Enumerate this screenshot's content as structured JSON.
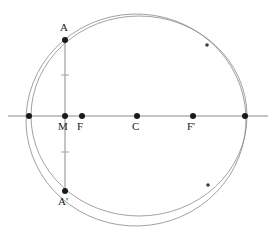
{
  "figure": {
    "title_fragment": "",
    "type": "geometry-diagram",
    "background_color": "#ffffff",
    "curve_color": "#8a8a8a",
    "axis_color": "#8a8a8a",
    "point_color": "#1a1a1a",
    "label_color": "#1a1a1a"
  },
  "labels": {
    "A": "A",
    "A_prime": "A'",
    "M": "M",
    "F": "F",
    "C": "C",
    "F_prime": "F'"
  },
  "chart_data": {
    "type": "scatter",
    "title": "",
    "xlabel": "",
    "ylabel": "",
    "grid": false,
    "legend": null,
    "xlim": [
      0,
      274
    ],
    "ylim": [
      228,
      0
    ],
    "axes": [
      {
        "name": "horizontal-axis",
        "x1": 8,
        "y1": 116,
        "x2": 268,
        "y2": 116
      },
      {
        "name": "vertical-chord",
        "x1": 65,
        "y1": 39,
        "x2": 65,
        "y2": 192
      }
    ],
    "ticks": [
      {
        "name": "upper-tick",
        "x": 65,
        "y": 75,
        "half_width": 4
      },
      {
        "name": "lower-tick",
        "x": 65,
        "y": 152,
        "half_width": 4
      }
    ],
    "points": [
      {
        "label": "",
        "name": "left-vertex-point",
        "x": 29,
        "y": 116,
        "r": 3.0
      },
      {
        "label": "M",
        "name": "point-m",
        "x": 65,
        "y": 116,
        "r": 3.0
      },
      {
        "label": "F",
        "name": "point-f",
        "x": 82,
        "y": 116,
        "r": 3.0
      },
      {
        "label": "C",
        "name": "point-c",
        "x": 137,
        "y": 116,
        "r": 3.0
      },
      {
        "label": "F'",
        "name": "point-f-prime",
        "x": 193,
        "y": 116,
        "r": 3.0
      },
      {
        "label": "",
        "name": "right-vertex-point",
        "x": 245,
        "y": 116,
        "r": 3.0
      },
      {
        "label": "A",
        "name": "point-a",
        "x": 65,
        "y": 40,
        "r": 3.0
      },
      {
        "label": "A'",
        "name": "point-a-prime",
        "x": 65,
        "y": 191,
        "r": 3.0
      },
      {
        "label": "",
        "name": "upper-right-intersection",
        "x": 207,
        "y": 45,
        "r": 1.8
      },
      {
        "label": "",
        "name": "lower-right-intersection",
        "x": 208,
        "y": 185,
        "r": 1.8
      }
    ],
    "curves": [
      {
        "name": "circle-curve",
        "kind": "ellipse",
        "cx": 139,
        "cy": 116,
        "rx": 108,
        "ry": 100,
        "rotation": 0
      },
      {
        "name": "ellipse-curve",
        "kind": "ellipse",
        "cx": 136,
        "cy": 120,
        "rx": 110,
        "ry": 106,
        "rotation": -2
      }
    ],
    "point_labels": [
      {
        "key": "A",
        "name": "label-a",
        "text": "A",
        "x": 60,
        "y": 22
      },
      {
        "key": "A_prime",
        "name": "label-a-prime",
        "text": "A'",
        "x": 58,
        "y": 196
      },
      {
        "key": "M",
        "name": "label-m",
        "text": "M",
        "x": 58,
        "y": 121
      },
      {
        "key": "F",
        "name": "label-f",
        "text": "F",
        "x": 77,
        "y": 121
      },
      {
        "key": "C",
        "name": "label-c",
        "text": "C",
        "x": 132,
        "y": 121
      },
      {
        "key": "F_prime",
        "name": "label-f-prime",
        "text": "F'",
        "x": 187,
        "y": 121
      }
    ]
  }
}
